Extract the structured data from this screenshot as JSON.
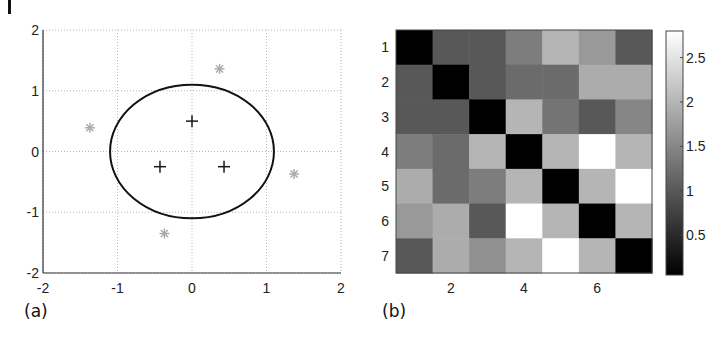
{
  "chart_data": [
    {
      "id": "a",
      "type": "scatter",
      "panel_label": "(a)",
      "title": "",
      "xlabel": "",
      "ylabel": "",
      "xlim": [
        -2,
        2
      ],
      "ylim": [
        -2,
        2
      ],
      "xticks": [
        -2,
        -1,
        0,
        1,
        2
      ],
      "yticks": [
        -2,
        -1,
        0,
        1,
        2
      ],
      "xtick_labels": [
        "-2",
        "-1",
        "0",
        "1",
        "2"
      ],
      "ytick_labels": [
        "-2",
        "-1",
        "0",
        "1",
        "2"
      ],
      "grid": true,
      "series": [
        {
          "name": "crosses",
          "marker": "+",
          "color": "#1a1a1a",
          "points": [
            [
              0,
              0.5
            ],
            [
              -0.43,
              -0.25
            ],
            [
              0.43,
              -0.25
            ]
          ]
        },
        {
          "name": "stars",
          "marker": "*",
          "color": "#a8a8a8",
          "points": [
            [
              0.37,
              1.36
            ],
            [
              -1.37,
              0.39
            ],
            [
              1.37,
              -0.37
            ],
            [
              -0.37,
              -1.35
            ]
          ]
        },
        {
          "name": "ellipse",
          "type": "curve",
          "color": "#111111",
          "center": [
            0,
            0
          ],
          "rx": 1.1,
          "ry": 1.1
        }
      ]
    },
    {
      "id": "b",
      "type": "heatmap",
      "panel_label": "(b)",
      "title": "",
      "xlabel": "",
      "ylabel": "",
      "rows": 7,
      "cols": 7,
      "xtick_labels": [
        "2",
        "4",
        "6"
      ],
      "xticks": [
        2,
        4,
        6
      ],
      "ytick_labels": [
        "1",
        "2",
        "3",
        "4",
        "5",
        "6",
        "7"
      ],
      "yticks": [
        1,
        2,
        3,
        4,
        5,
        6,
        7
      ],
      "colormap": "gray",
      "clim": [
        0.05,
        2.8
      ],
      "colorbar_ticks": [
        0.5,
        1,
        1.5,
        2,
        2.5
      ],
      "colorbar_tick_labels": [
        "0.5",
        "1",
        "1.5",
        "2",
        "2.5"
      ],
      "values": [
        [
          0.05,
          1.0,
          1.0,
          1.4,
          2.0,
          1.7,
          1.0
        ],
        [
          1.0,
          0.05,
          1.0,
          1.2,
          1.2,
          1.9,
          1.9
        ],
        [
          1.0,
          1.0,
          0.05,
          2.0,
          1.3,
          1.0,
          1.5
        ],
        [
          1.4,
          1.2,
          2.0,
          0.05,
          2.0,
          2.8,
          2.0
        ],
        [
          1.9,
          1.2,
          1.4,
          2.0,
          0.05,
          2.0,
          2.8
        ],
        [
          1.7,
          1.9,
          1.0,
          2.8,
          2.0,
          0.05,
          2.0
        ],
        [
          1.0,
          1.9,
          1.6,
          2.0,
          2.8,
          2.0,
          0.05
        ]
      ]
    }
  ]
}
